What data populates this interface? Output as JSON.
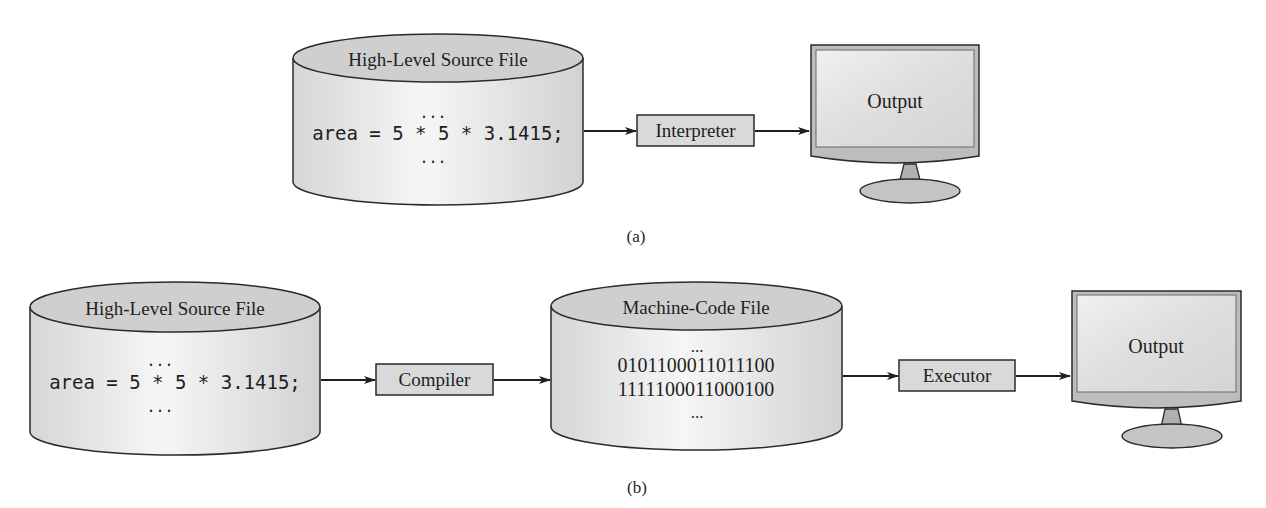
{
  "diagram_a": {
    "caption": "(a)",
    "source_file": {
      "title": "High-Level Source File",
      "dots_top": "...",
      "code": "area = 5 * 5 * 3.1415;",
      "dots_bottom": "..."
    },
    "process_box": {
      "label": "Interpreter"
    },
    "output": {
      "label": "Output"
    }
  },
  "diagram_b": {
    "caption": "(b)",
    "source_file": {
      "title": "High-Level Source File",
      "dots_top": "...",
      "code": "area = 5 * 5 * 3.1415;",
      "dots_bottom": "..."
    },
    "compiler_box": {
      "label": "Compiler"
    },
    "machine_code_file": {
      "title": "Machine-Code File",
      "dots_top": "...",
      "lines": [
        "0101100011011100",
        "1111100011000100"
      ],
      "dots_bottom": "..."
    },
    "executor_box": {
      "label": "Executor"
    },
    "output": {
      "label": "Output"
    }
  },
  "colors": {
    "stroke": "#2a2a2a",
    "cylinder_top": "#cfcfcf",
    "cylinder_body": "#e4e4e4",
    "box_fill": "#d9d9d9",
    "screen_fill": "#dcdcdc",
    "bezel_fill": "#b8b8b8"
  }
}
